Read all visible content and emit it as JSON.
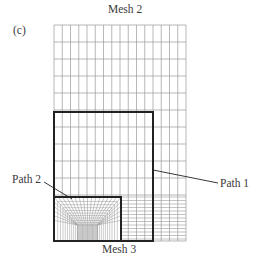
{
  "figure": {
    "panel_label": "(c)",
    "top_label": "Mesh 2",
    "bottom_label": "Mesh 3",
    "path1_label": "Path 1",
    "path2_label": "Path 2"
  },
  "geometry": {
    "grid": {
      "x0": 54,
      "x1": 186,
      "y0": 25,
      "y1": 241,
      "cols": 16,
      "coarse_row_step": 17,
      "coarse_rows_end": 195,
      "fine_row_step": 3.5
    },
    "path1_rect": {
      "x0": 54,
      "y0": 112,
      "x1": 153,
      "y1": 241
    },
    "path2_rect": {
      "x0": 54,
      "y0": 197,
      "x1": 121,
      "y1": 241
    },
    "path1_leader": {
      "x1": 153,
      "y1": 170,
      "x2": 218,
      "y2": 183
    },
    "path2_leader": {
      "x1": 44,
      "y1": 182,
      "x2": 72,
      "y2": 199
    }
  },
  "colors": {
    "grid_line": "#9a9a9a",
    "path_line": "#222222",
    "text": "#3a3a3a"
  }
}
